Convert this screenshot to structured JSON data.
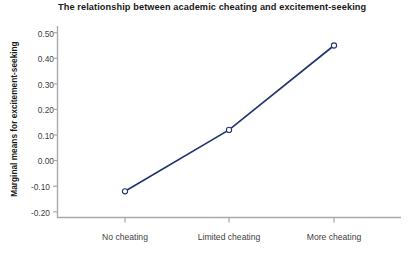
{
  "chart_data": {
    "type": "line",
    "title": "The relationship between academic cheating and excitement-seeking",
    "xlabel": "",
    "ylabel": "Marginal means for excitement-seeking",
    "categories": [
      "No cheating",
      "Limited cheating",
      "More cheating"
    ],
    "values": [
      -0.12,
      0.12,
      0.45
    ],
    "series": [
      {
        "name": "Marginal means for excitement-seeking",
        "values": [
          -0.12,
          0.12,
          0.45
        ]
      }
    ],
    "ylim": [
      -0.2,
      0.5
    ],
    "ytick_labels": [
      "0.50",
      "0.40",
      "0.30",
      "0.20",
      "0.10",
      "0.00",
      "-0.10",
      "-0.20"
    ],
    "ytick_values": [
      0.5,
      0.4,
      0.3,
      0.2,
      0.1,
      0.0,
      -0.1,
      -0.2
    ],
    "grid": false,
    "legend": "none",
    "marker": "open-circle",
    "line_color": "#23356f",
    "axis_color": "#a8a8a8",
    "background": "#ffffff"
  },
  "axis": {
    "y_labels": {
      "t0": "0.50",
      "t1": "0.40",
      "t2": "0.30",
      "t3": "0.20",
      "t4": "0.10",
      "t5": "0.00",
      "t6": "-0.10",
      "t7": "-0.20"
    },
    "x_labels": {
      "c0": "No cheating",
      "c1": "Limited cheating",
      "c2": "More cheating"
    }
  }
}
